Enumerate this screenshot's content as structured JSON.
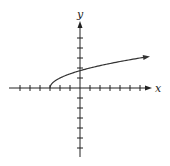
{
  "chart_data": {
    "type": "line",
    "title": "",
    "function": "y = sqrt(x + 3)",
    "xlabel": "x",
    "ylabel": "y",
    "xlim": [
      -7,
      7
    ],
    "ylim": [
      -7,
      6
    ],
    "grid": false,
    "x_ticks": [
      -6,
      -5,
      -4,
      -3,
      -2,
      -1,
      1,
      2,
      3,
      4,
      5,
      6
    ],
    "y_ticks": [
      -6,
      -5,
      -4,
      -3,
      -2,
      -1,
      1,
      2,
      3,
      4,
      5
    ],
    "series": [
      {
        "name": "sqrt(x+3)",
        "start_point": [
          -3,
          0
        ],
        "x": [
          -3,
          -2,
          -1,
          0,
          1,
          2,
          3,
          4,
          5,
          6,
          6.7
        ],
        "values": [
          0,
          1,
          1.41,
          1.73,
          2,
          2.24,
          2.45,
          2.65,
          2.83,
          3,
          3.11
        ],
        "end_arrow": true
      }
    ],
    "colors": {
      "axis": "#222222",
      "curve": "#333333"
    }
  }
}
